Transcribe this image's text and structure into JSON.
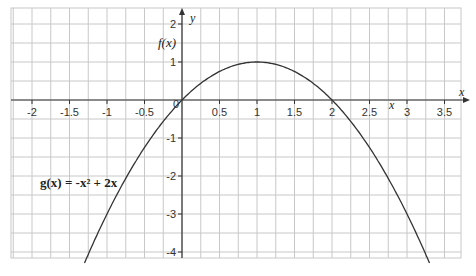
{
  "chart_data": {
    "type": "line",
    "title": "",
    "xlabel": "x",
    "ylabel": "y",
    "function_label": "g(x) = -x² + 2x",
    "y_axis_secondary_label": "f(x)",
    "x_axis_inner_label": "x",
    "xlim": [
      -2.25,
      3.75
    ],
    "ylim": [
      -4.5,
      2.5
    ],
    "grid": true,
    "grid_step_x": 0.25,
    "grid_step_y": 0.5,
    "x_ticks": [
      "-2",
      "-1.5",
      "-1",
      "-0.5",
      "0",
      "0.5",
      "1",
      "1.5",
      "2",
      "2.5",
      "3",
      "3.5"
    ],
    "y_ticks": [
      "2",
      "1",
      "-1",
      "-2",
      "-3",
      "-4"
    ],
    "series": [
      {
        "name": "g(x) = -x² + 2x",
        "x": [
          -1.3,
          -1,
          -0.5,
          0,
          0.5,
          1,
          1.5,
          2,
          2.5,
          3,
          3.3
        ],
        "y": [
          -4.29,
          -3,
          -1.25,
          0,
          0.75,
          1,
          0.75,
          0,
          -1.25,
          -3,
          -4.29
        ]
      }
    ]
  }
}
